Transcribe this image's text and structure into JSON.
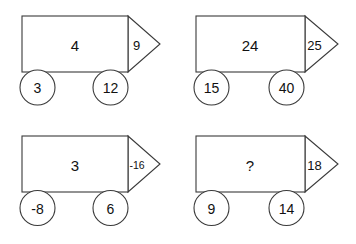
{
  "page": {
    "shape_type": "truck-arrow-diagram",
    "grid": {
      "columns": 2,
      "rows": 2
    },
    "colors": {
      "background": "#ffffff",
      "stroke": "#3a3a3a",
      "text": "#111111"
    }
  },
  "puzzles": [
    {
      "id": "puzzle-1",
      "body": "4",
      "tip": "9",
      "tip_size": "normal",
      "wheel_left": "3",
      "wheel_right": "12"
    },
    {
      "id": "puzzle-2",
      "body": "24",
      "tip": "25",
      "tip_size": "normal",
      "wheel_left": "15",
      "wheel_right": "40"
    },
    {
      "id": "puzzle-3",
      "body": "3",
      "tip": "-16",
      "tip_size": "small",
      "wheel_left": "-8",
      "wheel_right": "6"
    },
    {
      "id": "puzzle-4",
      "body": "?",
      "tip": "18",
      "tip_size": "normal",
      "wheel_left": "9",
      "wheel_right": "14"
    }
  ]
}
